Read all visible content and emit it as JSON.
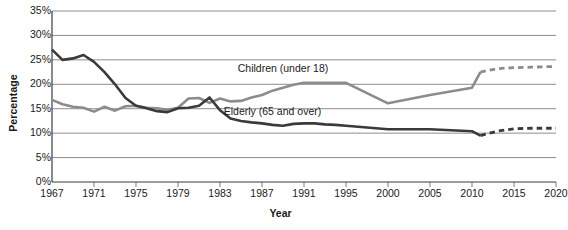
{
  "chart_data": {
    "type": "line",
    "title": "",
    "xlabel": "Year",
    "ylabel": "Percentage",
    "ylim": [
      0,
      35
    ],
    "ytick_labels": [
      "0%",
      "5%",
      "10%",
      "15%",
      "20%",
      "25%",
      "30%",
      "35%"
    ],
    "ytick_values": [
      0,
      5,
      10,
      15,
      20,
      25,
      30,
      35
    ],
    "xlim": [
      1967,
      2021
    ],
    "xtick_labels": [
      "1967",
      "1971",
      "1975",
      "1979",
      "1983",
      "1987",
      "1991",
      "1995",
      "2000",
      "2005",
      "2010",
      "2015",
      "2020"
    ],
    "xtick_values": [
      1967,
      1971,
      1975,
      1979,
      1983,
      1987,
      1991,
      1995,
      2000,
      2005,
      2010,
      2015,
      2020
    ],
    "grid": true,
    "legend": "inline-labels",
    "series": [
      {
        "name": "Children (under 18)",
        "color": "#8c8c8c",
        "label_x": 1989,
        "label_y": 22.6,
        "projection_note": "dashed after 2011",
        "x": [
          1967,
          1968,
          1969,
          1970,
          1971,
          1972,
          1973,
          1974,
          1975,
          1976,
          1977,
          1978,
          1979,
          1980,
          1981,
          1982,
          1983,
          1984,
          1985,
          1986,
          1987,
          1988,
          1989,
          1990,
          1991,
          1992,
          1993,
          1994,
          1995,
          2000,
          2005,
          2010,
          2011
        ],
        "values": [
          16.8,
          15.9,
          15.4,
          15.2,
          14.4,
          15.4,
          14.6,
          15.5,
          15.6,
          15.2,
          15.1,
          14.8,
          15.2,
          17.1,
          17.2,
          16.2,
          17.1,
          16.5,
          16.6,
          17.3,
          17.8,
          18.7,
          19.3,
          19.9,
          20.3,
          20.3,
          20.3,
          20.3,
          20.3,
          16.1,
          17.8,
          19.3,
          22.5
        ],
        "proj_x": [
          2011,
          2013,
          2015,
          2017,
          2019,
          2020
        ],
        "proj_values": [
          22.5,
          23.2,
          23.4,
          23.5,
          23.6,
          23.6
        ]
      },
      {
        "name": "Elderly (65 and over)",
        "color": "#3a3a3a",
        "label_x": 1988,
        "label_y": 13.7,
        "projection_note": "dashed after 2011",
        "x": [
          1967,
          1968,
          1969,
          1970,
          1971,
          1972,
          1973,
          1974,
          1975,
          1976,
          1977,
          1978,
          1979,
          1980,
          1981,
          1982,
          1983,
          1984,
          1985,
          1986,
          1987,
          1988,
          1989,
          1990,
          1991,
          1992,
          1993,
          1994,
          1995,
          2000,
          2005,
          2010,
          2011
        ],
        "values": [
          27.1,
          25.0,
          25.3,
          26.0,
          24.6,
          22.5,
          20.0,
          17.2,
          15.6,
          15.1,
          14.5,
          14.3,
          15.1,
          15.2,
          15.6,
          17.3,
          14.7,
          13.0,
          12.5,
          12.2,
          12.0,
          11.7,
          11.5,
          11.9,
          12.0,
          12.0,
          11.8,
          11.7,
          11.5,
          10.8,
          10.8,
          10.4,
          9.5
        ],
        "proj_x": [
          2011,
          2013,
          2015,
          2017,
          2019,
          2020
        ],
        "proj_values": [
          9.5,
          10.4,
          10.9,
          11.0,
          11.0,
          11.0
        ]
      }
    ]
  },
  "axis": {
    "y_title": "Percentage",
    "x_title": "Year"
  }
}
